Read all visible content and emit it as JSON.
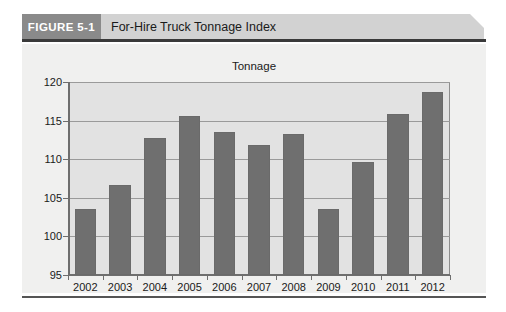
{
  "figure": {
    "tag": "FIGURE 5-1",
    "title": "For-Hire Truck Tonnage Index"
  },
  "colors": {
    "tag_background": "#8a8a8a",
    "header_background": "#d2d2d2",
    "panel_background": "#f0f0ef",
    "plot_background": "#e2e2e2",
    "bar_fill": "#6f6f6f",
    "gridline": "#9a9a9a",
    "axis": "#6e6e6e",
    "rule": "#3a3a3a"
  },
  "chart_data": {
    "type": "bar",
    "title": "Tonnage",
    "xlabel": "",
    "ylabel": "",
    "categories": [
      "2002",
      "2003",
      "2004",
      "2005",
      "2006",
      "2007",
      "2008",
      "2009",
      "2010",
      "2011",
      "2012"
    ],
    "values": [
      103.6,
      106.7,
      112.8,
      115.6,
      113.5,
      111.9,
      113.2,
      103.6,
      109.6,
      115.8,
      118.7
    ],
    "ylim": [
      95,
      120
    ],
    "yticks": [
      95,
      100,
      105,
      110,
      115,
      120
    ],
    "ytick_labels": [
      "95",
      "100",
      "105",
      "110",
      "115",
      "120"
    ],
    "grid": true,
    "legend": false,
    "legend_position": "none"
  }
}
